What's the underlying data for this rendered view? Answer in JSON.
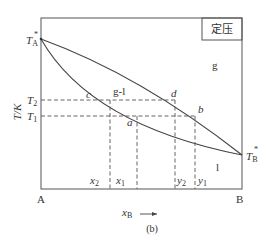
{
  "diagram": {
    "type": "phase-diagram-binary-T-x",
    "caption": "(b)",
    "condition_label": "定压",
    "y_axis_label": "T/K",
    "x_axis_label": "x",
    "x_axis_sub": "B",
    "x_axis_arrow": "→",
    "corner_left": "A",
    "corner_right": "B",
    "TA_label": "T",
    "TA_sub": "A",
    "TB_label": "T",
    "TB_sub": "B",
    "star": "*",
    "T2_label": "T",
    "T2_sub": "2",
    "T1_label": "T",
    "T1_sub": "1",
    "region_gas": "g",
    "region_liquid": "l",
    "region_two_phase": "g-l",
    "point_a": "a",
    "point_b": "b",
    "point_c": "c",
    "point_d": "d",
    "x2_label": "x",
    "x2_sub": "2",
    "x1_label": "x",
    "x1_sub": "1",
    "y2_label": "y",
    "y2_sub": "2",
    "y1_label": "y",
    "y1_sub": "1",
    "colors": {
      "line": "#444444",
      "dash": "#555555",
      "text": "#333333"
    }
  }
}
